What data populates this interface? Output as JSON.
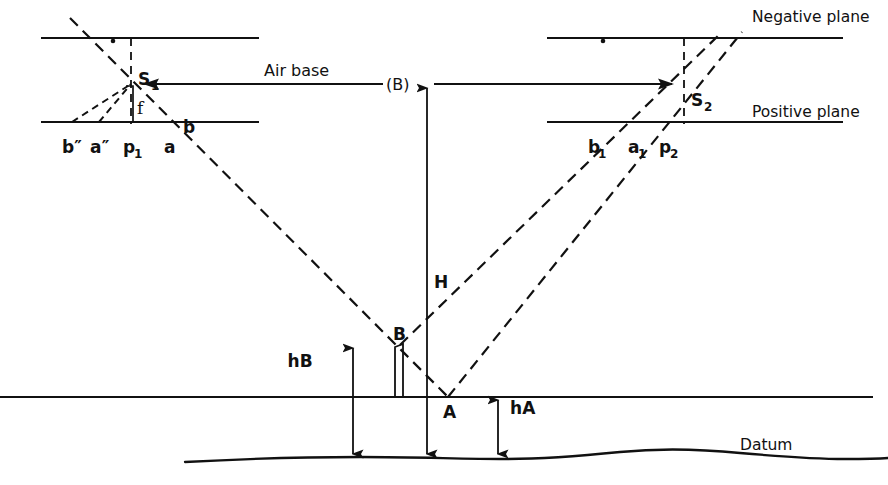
{
  "diagram": {
    "type": "technical-line-diagram",
    "background_color": "#ffffff",
    "line_color": "#111111",
    "width": 888,
    "height": 485
  },
  "labels": {
    "negative_plane": "Negative plane",
    "positive_plane": "Positive plane",
    "air_base": "Air base",
    "air_base_symbol": "(B)",
    "datum": "Datum",
    "station_1": "S",
    "station_1_sub": "1",
    "station_2": "S",
    "station_2_sub": "2",
    "focal_length": "f",
    "flying_height": "H",
    "height_b": "hB",
    "height_a": "hA",
    "ground_point_a": "A",
    "ground_point_b": "B",
    "left_image_b_dprime": "b″",
    "left_image_a_dprime": "a″",
    "left_principal_point": "p",
    "left_principal_point_sub": "1",
    "left_image_a": "a",
    "left_image_b": "b",
    "right_image_b1": "b",
    "right_image_b1_sub": "1",
    "right_image_a1": "a",
    "right_image_a1_sub": "1",
    "right_principal_point": "p",
    "right_principal_point_sub": "2"
  },
  "geometry": {
    "negative_plane_y": 38,
    "positive_plane_y": 122,
    "ground_line_y": 397,
    "datum_y": 458,
    "air_base_y": 84,
    "station_1": {
      "x": 131,
      "y": 84
    },
    "station_2": {
      "x": 684,
      "y": 86
    },
    "point_a": {
      "x": 448,
      "y": 397
    },
    "point_b": {
      "x": 400,
      "y": 345
    },
    "left_plane_x_start": 42,
    "left_plane_x_end": 258,
    "right_plane_x_start": 548,
    "right_plane_x_end": 842,
    "h_arrow_x": 427,
    "hb_arrow_x": 353,
    "ha_arrow_x": 498
  }
}
